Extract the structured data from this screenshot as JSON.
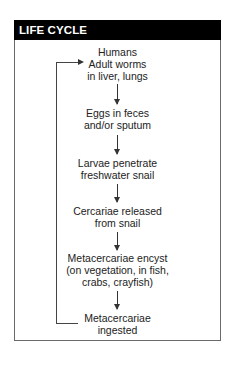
{
  "header": {
    "title": "LIFE CYCLE"
  },
  "steps": [
    {
      "lines": [
        "Humans",
        "Adult worms",
        "in liver, lungs"
      ]
    },
    {
      "lines": [
        "Eggs in feces",
        "and/or sputum"
      ]
    },
    {
      "lines": [
        "Larvae penetrate",
        "freshwater snail"
      ]
    },
    {
      "lines": [
        "Cercariae released",
        "from snail"
      ]
    },
    {
      "lines": [
        "Metacercariae encyst",
        "(on vegetation, in fish,",
        "crabs, crayfish)"
      ]
    },
    {
      "lines": [
        "Metacercariae",
        "ingested"
      ]
    }
  ],
  "colors": {
    "header_bg": "#000000",
    "header_text": "#ffffff",
    "border": "#6a6a6a"
  }
}
